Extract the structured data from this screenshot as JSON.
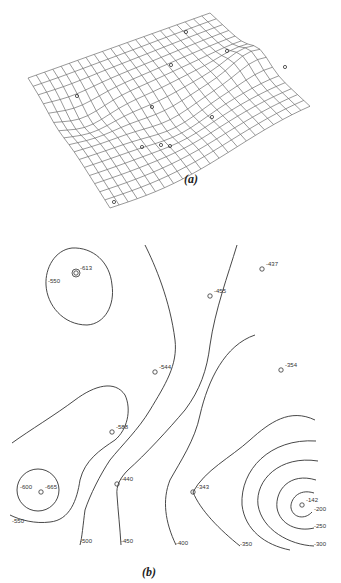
{
  "chart_data": [
    {
      "type": "surface",
      "panel": "a",
      "caption": "(a)",
      "description": "3D wireframe mesh surface with sample points marked",
      "grid": true,
      "sample_points_count": 11
    },
    {
      "type": "contour",
      "panel": "b",
      "caption": "(b)",
      "contour_levels": [
        -600,
        -550,
        -500,
        -450,
        -400,
        -350,
        -300,
        -250,
        -200
      ],
      "contour_labels": [
        {
          "label": "-550",
          "x": 48,
          "y": 283
        },
        {
          "label": "-600",
          "x": 20,
          "y": 489
        },
        {
          "label": "-550",
          "x": 12,
          "y": 523
        },
        {
          "label": "-500",
          "x": 80,
          "y": 543
        },
        {
          "label": "-450",
          "x": 121,
          "y": 543
        },
        {
          "label": "-400",
          "x": 176,
          "y": 545
        },
        {
          "label": "-350",
          "x": 240,
          "y": 546
        },
        {
          "label": "-300",
          "x": 314,
          "y": 546
        },
        {
          "label": "-250",
          "x": 314,
          "y": 528
        },
        {
          "label": "-200",
          "x": 314,
          "y": 511
        }
      ],
      "data_points": [
        {
          "label": "-613",
          "x": 76,
          "y": 273
        },
        {
          "label": "-437",
          "x": 262,
          "y": 269
        },
        {
          "label": "-455",
          "x": 210,
          "y": 296
        },
        {
          "label": "-544",
          "x": 155,
          "y": 372
        },
        {
          "label": "-354",
          "x": 281,
          "y": 370
        },
        {
          "label": "-588",
          "x": 112,
          "y": 432
        },
        {
          "label": "-665",
          "x": 41,
          "y": 492
        },
        {
          "label": "-440",
          "x": 117,
          "y": 484
        },
        {
          "label": "-343",
          "x": 193,
          "y": 492
        },
        {
          "label": "-142",
          "x": 302,
          "y": 505
        }
      ]
    }
  ],
  "captions": {
    "a": "(a)",
    "b": "(b)"
  }
}
